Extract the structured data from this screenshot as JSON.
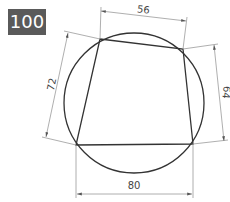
{
  "problem": {
    "number": "100"
  },
  "diagram": {
    "colors": {
      "badge_bg": "#5a5a5a",
      "badge_text": "#ffffff",
      "shape_stroke": "#333333",
      "dimension_stroke": "#9a9a9a",
      "dimension_text": "#444444"
    },
    "dimensions": {
      "top": "56",
      "right": "64",
      "left": "72",
      "bottom": "80"
    }
  }
}
